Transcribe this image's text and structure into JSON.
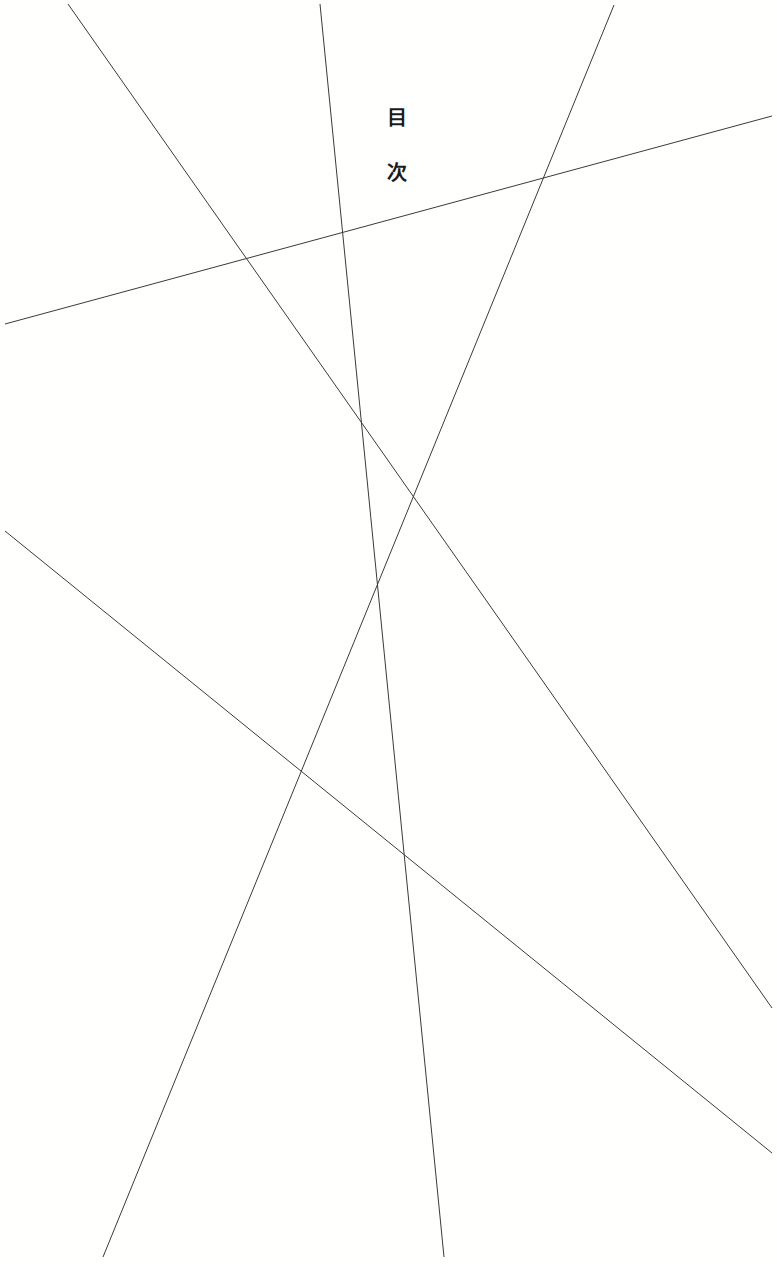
{
  "page": {
    "title_chars": [
      "目",
      "次"
    ],
    "background": "#fffffd",
    "line_color": "#3a3a3a"
  },
  "decoration": {
    "lines": [
      {
        "x1": 68,
        "y1": 4,
        "x2": 772,
        "y2": 1008
      },
      {
        "x1": 320,
        "y1": 4,
        "x2": 444,
        "y2": 1257
      },
      {
        "x1": 614,
        "y1": 5,
        "x2": 103,
        "y2": 1257
      },
      {
        "x1": 5,
        "y1": 324,
        "x2": 772,
        "y2": 116
      },
      {
        "x1": 5,
        "y1": 531,
        "x2": 772,
        "y2": 1153
      }
    ]
  }
}
